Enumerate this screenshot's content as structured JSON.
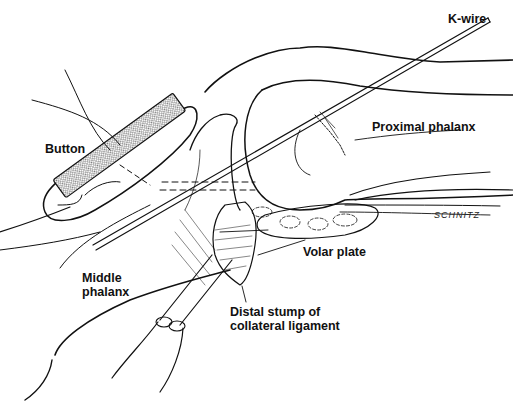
{
  "figure": {
    "type": "surgical anatomical illustration",
    "labels": {
      "k_wire": "K-wire",
      "button": "Button",
      "proximal_phalanx": "Proximal phalanx",
      "volar_plate": "Volar plate",
      "middle_phalanx_line1": "Middle",
      "middle_phalanx_line2": "phalanx",
      "distal_stump_line1": "Distal stump of",
      "distal_stump_line2": "collateral ligament"
    },
    "signature": "SCHNITZ",
    "colors": {
      "ink": "#111111",
      "background": "#ffffff"
    }
  }
}
